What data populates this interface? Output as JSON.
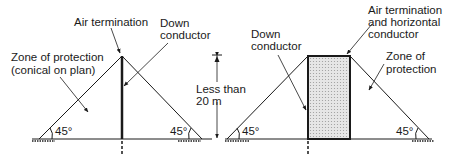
{
  "left_diagram": {
    "air_termination": "Air termination",
    "down_conductor_line1": "Down",
    "down_conductor_line2": "conductor",
    "zone_line1": "Zone of protection",
    "zone_line2": "(conical on plan)",
    "angle_left": "45°",
    "angle_right": "45°"
  },
  "dimension": {
    "line1": "Less than",
    "line2": "20 m"
  },
  "right_diagram": {
    "down_conductor_line1": "Down",
    "down_conductor_line2": "conductor",
    "air_termination_line1": "Air termination",
    "air_termination_line2": "and horizontal",
    "air_termination_line3": "conductor",
    "zone_line1": "Zone of",
    "zone_line2": "protection",
    "angle_left": "45°",
    "angle_right": "45°"
  },
  "colors": {
    "line": "#1a1a1a",
    "fill": "#d9d9d9"
  }
}
